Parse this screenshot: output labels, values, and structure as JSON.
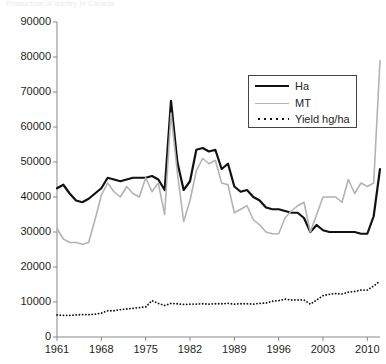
{
  "faint_header": "Production of Barley in Canada",
  "chart_data": {
    "type": "line",
    "title": "",
    "xlabel": "",
    "ylabel": "",
    "xlim": [
      1961,
      2012
    ],
    "ylim": [
      0,
      90000
    ],
    "grid": false,
    "legend_position": "top-right",
    "y_ticks": [
      0,
      10000,
      20000,
      30000,
      40000,
      50000,
      60000,
      70000,
      80000,
      90000
    ],
    "y_tick_labels": [
      "0",
      "10000",
      "20000",
      "30000",
      "40000",
      "50000",
      "60000",
      "70000",
      "80000",
      "90000"
    ],
    "x_ticks": [
      1961,
      1968,
      1975,
      1982,
      1989,
      1996,
      2003,
      2010
    ],
    "x_tick_labels": [
      "1961",
      "1968",
      "1975",
      "1982",
      "1989",
      "1996",
      "2003",
      "2010"
    ],
    "x": [
      1961,
      1962,
      1963,
      1964,
      1965,
      1966,
      1967,
      1968,
      1969,
      1970,
      1971,
      1972,
      1973,
      1974,
      1975,
      1976,
      1977,
      1978,
      1979,
      1980,
      1981,
      1982,
      1983,
      1984,
      1985,
      1986,
      1987,
      1988,
      1989,
      1990,
      1991,
      1992,
      1993,
      1994,
      1995,
      1996,
      1997,
      1998,
      1999,
      2000,
      2001,
      2002,
      2003,
      2004,
      2005,
      2006,
      2007,
      2008,
      2009,
      2010,
      2011,
      2012
    ],
    "series": [
      {
        "name": "Ha",
        "color": "#111111",
        "style": "solid",
        "width": 2.2,
        "values": [
          42500,
          43500,
          41000,
          39000,
          38500,
          39500,
          41000,
          42500,
          45500,
          45000,
          44500,
          45000,
          45500,
          45500,
          45500,
          46000,
          45000,
          42000,
          67500,
          50000,
          42000,
          44500,
          53500,
          54000,
          53000,
          53500,
          48000,
          49500,
          43000,
          41500,
          42000,
          40000,
          39000,
          37000,
          36500,
          36500,
          36000,
          35500,
          35500,
          34000,
          30000,
          32000,
          30500,
          30000,
          30000,
          30000,
          30000,
          30000,
          29500,
          29500,
          34500,
          48000
        ]
      },
      {
        "name": "MT",
        "color": "#b3b3b3",
        "style": "solid",
        "width": 1.6,
        "values": [
          31000,
          28000,
          27000,
          27000,
          26500,
          27000,
          33500,
          40500,
          44000,
          41500,
          40000,
          43000,
          41000,
          40000,
          45500,
          41500,
          44000,
          35000,
          64000,
          47000,
          33000,
          39000,
          47500,
          51000,
          49500,
          50500,
          44000,
          43500,
          35500,
          36500,
          37500,
          33500,
          32000,
          30000,
          29500,
          29500,
          34000,
          36000,
          37500,
          38500,
          30000,
          35000,
          40000,
          40000,
          40000,
          38500,
          45000,
          41000,
          44000,
          43000,
          44000,
          79000
        ]
      },
      {
        "name": "Yield hg/ha",
        "color": "#111111",
        "style": "dotted",
        "width": 1.6,
        "values": [
          6300,
          6200,
          6200,
          6300,
          6400,
          6400,
          6500,
          6800,
          7500,
          7500,
          7800,
          8000,
          8200,
          8400,
          8600,
          10400,
          9600,
          9000,
          9600,
          9500,
          9300,
          9400,
          9400,
          9500,
          9400,
          9500,
          9500,
          9600,
          9400,
          9500,
          9500,
          9400,
          9600,
          9700,
          10200,
          10400,
          10800,
          10600,
          10600,
          10600,
          9400,
          10600,
          11800,
          12200,
          12400,
          12300,
          12800,
          13000,
          13400,
          13400,
          14600,
          16000
        ]
      }
    ]
  },
  "legend": {
    "items": [
      {
        "label": "Ha",
        "icon": "solid-line-black"
      },
      {
        "label": "MT",
        "icon": "solid-line-gray"
      },
      {
        "label": "Yield hg/ha",
        "icon": "dotted-line-black"
      }
    ]
  },
  "geometry": {
    "plot_left": 57,
    "plot_right": 380,
    "plot_top": 22,
    "plot_bottom": 337
  }
}
